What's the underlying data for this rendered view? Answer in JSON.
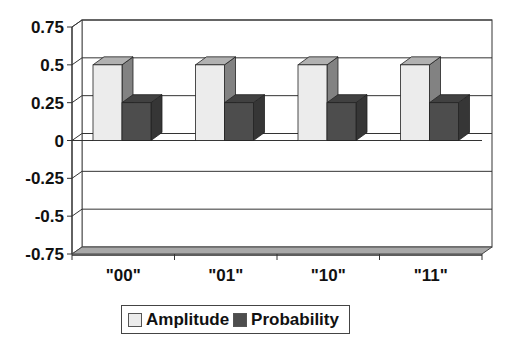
{
  "chart_data": {
    "type": "bar",
    "title": "",
    "xlabel": "",
    "ylabel": "",
    "categories": [
      "\"00\"",
      "\"01\"",
      "\"10\"",
      "\"11\""
    ],
    "series": [
      {
        "name": "Amplitude",
        "values": [
          0.5,
          0.5,
          0.5,
          0.5
        ],
        "color": "#ececec"
      },
      {
        "name": "Probability",
        "values": [
          0.25,
          0.25,
          0.25,
          0.25
        ],
        "color": "#4d4d4d"
      }
    ],
    "ylim": [
      -0.75,
      0.75
    ],
    "yticks": [
      "0.75",
      "0.5",
      "0.25",
      "0",
      "-0.25",
      "-0.5",
      "-0.75"
    ],
    "grid": true,
    "legend_position": "bottom",
    "style": "3d-clustered-column"
  },
  "legend": {
    "items": [
      {
        "label": "Amplitude",
        "color": "#ececec"
      },
      {
        "label": "Probability",
        "color": "#4d4d4d"
      }
    ]
  }
}
